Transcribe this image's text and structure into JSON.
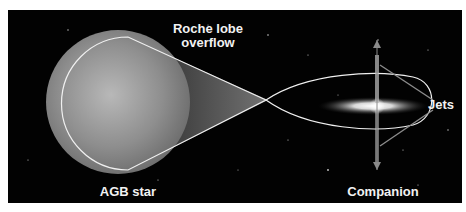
{
  "diagram": {
    "labels": {
      "roche_lobe": [
        "Roche lobe",
        "overflow"
      ],
      "agb_star": "AGB star",
      "companion": "Companion",
      "jets": "Jets"
    },
    "colors": {
      "background": "#020202",
      "outline": "#f0f0f0",
      "star": "#8a8a8a",
      "pointer_lines": "#8c8c8c",
      "text": "#f2f2f2"
    }
  }
}
